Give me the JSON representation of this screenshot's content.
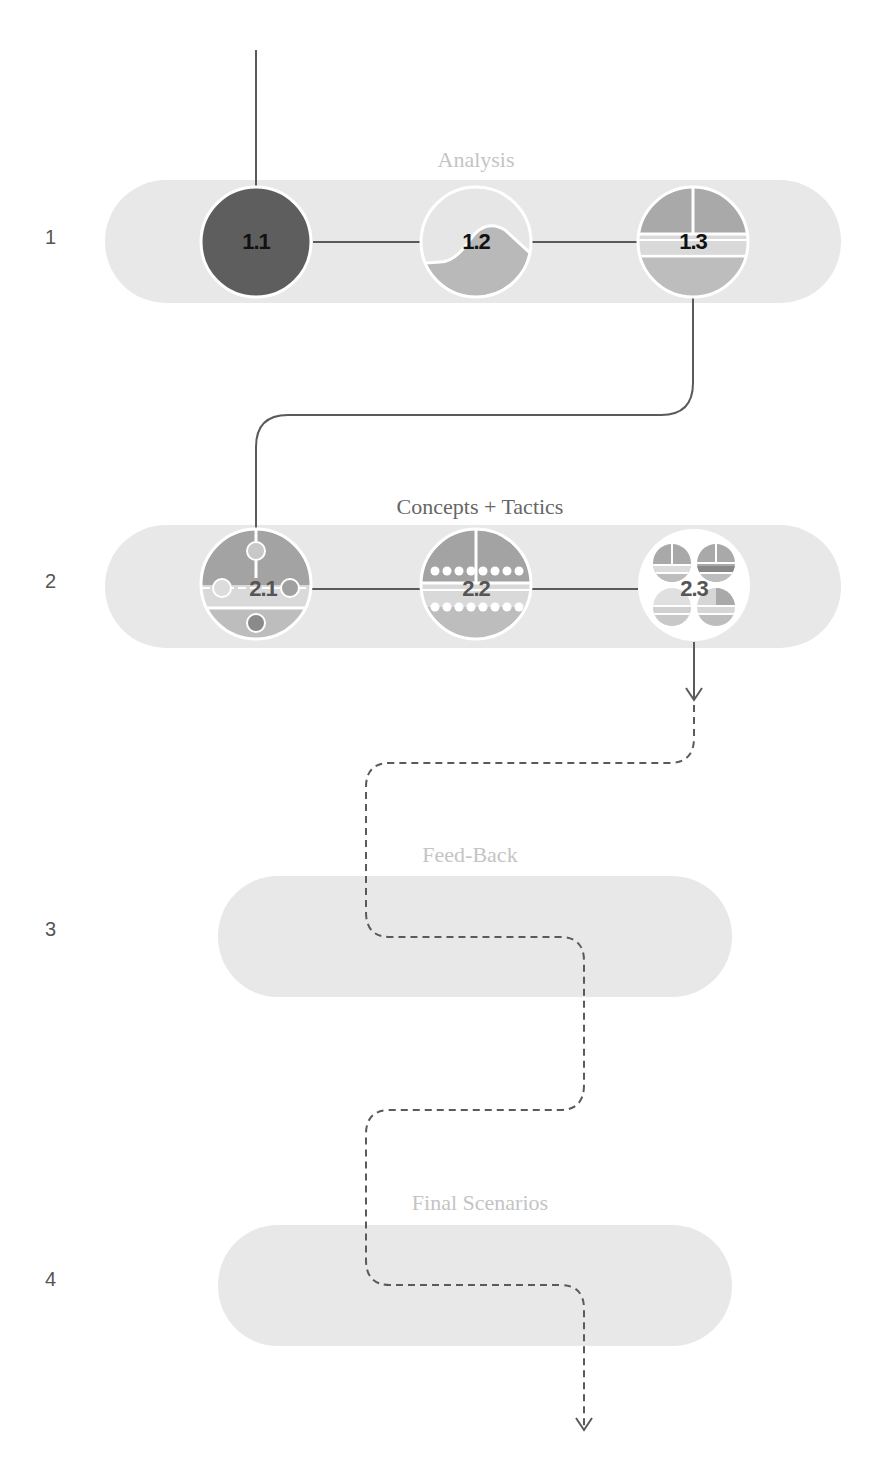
{
  "phases": [
    {
      "number": "1",
      "title": "Analysis",
      "title_color": "#c4c4c4",
      "nodes": [
        "1.1",
        "1.2",
        "1.3"
      ]
    },
    {
      "number": "2",
      "title": "Concepts + Tactics",
      "title_color": "#666666",
      "nodes": [
        "2.1",
        "2.2",
        "2.3"
      ]
    },
    {
      "number": "3",
      "title": "Feed-Back",
      "title_color": "#c4c4c4",
      "nodes": []
    },
    {
      "number": "4",
      "title": "Final Scenarios",
      "title_color": "#c4c4c4",
      "nodes": []
    }
  ],
  "colors": {
    "pill": "#e8e8e8",
    "dark": "#5e5e5e",
    "mid": "#a9a9a9",
    "light": "#d6d6d6",
    "line": "#5a5a5a",
    "white": "#ffffff"
  }
}
